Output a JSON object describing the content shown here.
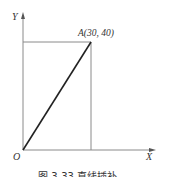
{
  "diagram": {
    "type": "linear-interpolation",
    "axes": {
      "x_label": "X",
      "y_label": "Y",
      "origin_label": "O"
    },
    "points": [
      {
        "name": "O",
        "x": 0,
        "y": 0
      },
      {
        "name": "A",
        "label": "A(30, 40)",
        "x": 30,
        "y": 40
      }
    ],
    "caption": "图 3-33  直线插补"
  },
  "colors": {
    "line": "#333333",
    "guide": "#8a8a8a",
    "axis": "#8a8a8a"
  }
}
